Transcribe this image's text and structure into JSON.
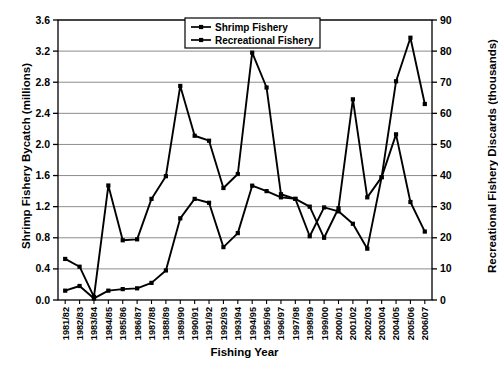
{
  "chart_data": {
    "type": "line",
    "title": "",
    "xlabel": "Fishing Year",
    "ylabel": "Shrimp Fishery Bycatch (millions)",
    "y2label": "Recreational Fishery Discards (thousands)",
    "grid": true,
    "legend_position": "top-center",
    "ylim": [
      0.0,
      3.6
    ],
    "ytick_step": 0.4,
    "y2lim": [
      0,
      90
    ],
    "y2tick_step": 10,
    "yticks": [
      "0.0",
      "0.4",
      "0.8",
      "1.2",
      "1.6",
      "2.0",
      "2.4",
      "2.8",
      "3.2",
      "3.6"
    ],
    "y2ticks": [
      "0",
      "10",
      "20",
      "30",
      "40",
      "50",
      "60",
      "70",
      "80",
      "90"
    ],
    "categories": [
      "1981/82",
      "1982/83",
      "1983/84",
      "1984/85",
      "1985/86",
      "1986/87",
      "1987/88",
      "1988/89",
      "1989/90",
      "1990/91",
      "1991/92",
      "1992/93",
      "1993/94",
      "1994/95",
      "1995/96",
      "1996/97",
      "1997/98",
      "1998/99",
      "1999/00",
      "2000/01",
      "2001/02",
      "2002/03",
      "2003/04",
      "2004/05",
      "2005/06",
      "2006/07"
    ],
    "series": [
      {
        "name": "Shrimp Fishery",
        "axis": "left",
        "units": "millions",
        "color": "#000000",
        "values": [
          0.12,
          0.18,
          0.02,
          0.12,
          0.14,
          0.15,
          0.22,
          0.38,
          1.05,
          1.3,
          1.25,
          0.68,
          0.86,
          1.47,
          1.4,
          1.32,
          1.3,
          0.82,
          1.19,
          1.14,
          0.98,
          0.66,
          1.58,
          2.13,
          1.26,
          0.88
        ]
      },
      {
        "name": "Recreational Fishery",
        "axis": "right",
        "units": "thousands",
        "color": "#000000",
        "values": [
          13.2,
          10.7,
          1.0,
          36.8,
          19.2,
          19.5,
          32.5,
          39.8,
          68.8,
          52.8,
          51.2,
          36.0,
          40.5,
          79.5,
          68.3,
          34.0,
          32.5,
          30.0,
          20.0,
          29.5,
          64.5,
          33.0,
          39.5,
          70.3,
          84.3,
          63.0
        ]
      }
    ]
  },
  "legend": {
    "items": [
      {
        "label": "Shrimp Fishery"
      },
      {
        "label": "Recreational Fishery"
      }
    ]
  }
}
